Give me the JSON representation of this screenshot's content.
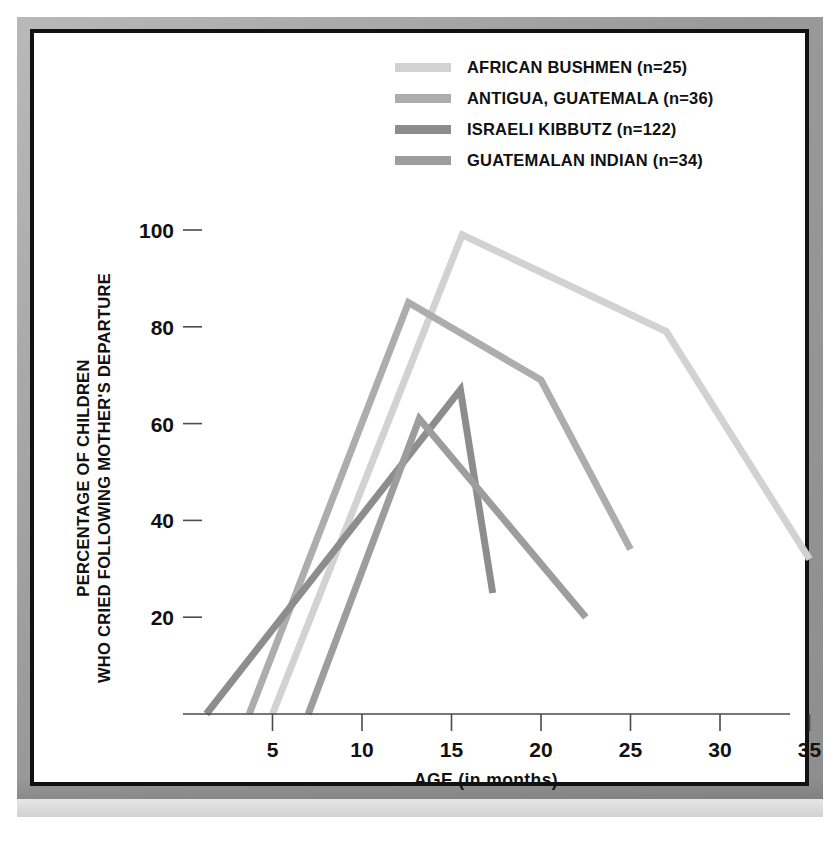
{
  "figure": {
    "background": "#ffffff",
    "frame_color": "#111111",
    "mat_color": "#a5a5a5"
  },
  "legend": {
    "position": "top-right",
    "entries": [
      {
        "label": "AFRICAN BUSHMEN (n=25)",
        "color": "#d2d2d2",
        "swatch": "legend-swatch-african-bushmen"
      },
      {
        "label": "ANTIGUA, GUATEMALA (n=36)",
        "color": "#adadad",
        "swatch": "legend-swatch-antigua-guatemala"
      },
      {
        "label": "ISRAELI KIBBUTZ (n=122)",
        "color": "#8d8d8d",
        "swatch": "legend-swatch-israeli-kibbutz"
      },
      {
        "label": "GUATEMALAN INDIAN (n=34)",
        "color": "#9d9d9d",
        "swatch": "legend-swatch-guatemalan-indian"
      }
    ]
  },
  "axes": {
    "x_title": "AGE (in months)",
    "y_title_line1": "PERCENTAGE OF CHILDREN",
    "y_title_line2": "WHO CRIED FOLLOWING MOTHER'S DEPARTURE",
    "x_ticks": [
      "5",
      "10",
      "15",
      "20",
      "25",
      "30",
      "35"
    ],
    "y_ticks": [
      "20",
      "40",
      "60",
      "80",
      "100"
    ]
  },
  "chart_data": {
    "type": "line",
    "title": "",
    "xlabel": "AGE (in months)",
    "ylabel": "PERCENTAGE OF CHILDREN WHO CRIED FOLLOWING MOTHER'S DEPARTURE",
    "xlim": [
      0,
      36
    ],
    "ylim": [
      0,
      105
    ],
    "xticks": [
      5,
      10,
      15,
      20,
      25,
      30,
      35
    ],
    "yticks": [
      20,
      40,
      60,
      80,
      100
    ],
    "grid": false,
    "legend_position": "top-right",
    "series": [
      {
        "name": "AFRICAN BUSHMEN (n=25)",
        "n": 25,
        "color": "#d2d2d2",
        "x": [
          5.0,
          15.6,
          27.0,
          35.0
        ],
        "y": [
          0,
          99,
          79,
          32
        ]
      },
      {
        "name": "ANTIGUA, GUATEMALA (n=36)",
        "n": 36,
        "color": "#adadad",
        "x": [
          3.7,
          12.6,
          20.0,
          25.0
        ],
        "y": [
          0,
          85,
          69,
          34
        ]
      },
      {
        "name": "ISRAELI KIBBUTZ (n=122)",
        "n": 122,
        "color": "#8d8d8d",
        "x": [
          1.3,
          15.5,
          17.3
        ],
        "y": [
          0,
          67,
          25
        ]
      },
      {
        "name": "GUATEMALAN INDIAN (n=34)",
        "n": 34,
        "color": "#9d9d9d",
        "x": [
          7.0,
          13.2,
          22.5
        ],
        "y": [
          0,
          61,
          20
        ]
      }
    ]
  }
}
